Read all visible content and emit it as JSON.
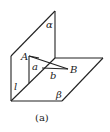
{
  "figure": {
    "caption": "(a)",
    "labels": {
      "plane_alpha": "α",
      "plane_beta": "β",
      "line_l": "l",
      "point_A": "A",
      "point_B": "B",
      "segment_a": "a",
      "segment_b": "b"
    },
    "colors": {
      "stroke": "#222222",
      "background": "#ffffff"
    }
  }
}
